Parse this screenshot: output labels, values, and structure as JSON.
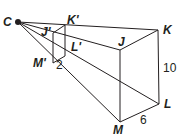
{
  "diagram": {
    "type": "dilation-rectangular-prism",
    "center": {
      "label": "C"
    },
    "image_prism": {
      "labels": {
        "j": "J'",
        "k": "K'",
        "l": "L'",
        "m": "M'"
      },
      "dimension_label": "2"
    },
    "preimage_prism": {
      "labels": {
        "j": "J",
        "k": "K",
        "l": "L",
        "m": "M"
      },
      "height_label": "10",
      "depth_label": "6"
    },
    "colors": {
      "stroke": "#231f20",
      "background": "#ffffff"
    }
  }
}
